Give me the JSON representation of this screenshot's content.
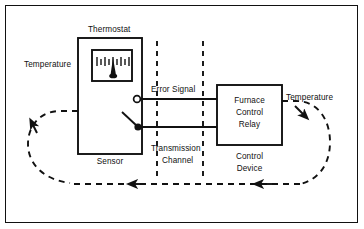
{
  "diagram": {
    "type": "block-diagram",
    "colors": {
      "line": "#111111",
      "background": "#ffffff",
      "text": "#101010"
    },
    "blocks": [
      {
        "id": "thermostat",
        "label": "Thermostat",
        "caption": "Sensor",
        "x": 78,
        "y": 38,
        "w": 64,
        "h": 116
      },
      {
        "id": "control-device",
        "label": "Furnace Control Relay",
        "label_lines": [
          "Furnace",
          "Control",
          "Relay"
        ],
        "caption_lines": [
          "Control",
          "Device"
        ],
        "x": 217,
        "y": 85,
        "w": 65,
        "h": 60
      }
    ],
    "labels": {
      "thermostat": "Thermostat",
      "temperature_in": "Temperature",
      "temperature_out": "Temperature",
      "error_signal": "Error Signal",
      "sensor": "Sensor",
      "transmission_line1": "Transmission",
      "transmission_line2": "Channel",
      "furnace_line1": "Furnace",
      "furnace_line2": "Control",
      "furnace_line3": "Relay",
      "control_device_line1": "Control",
      "control_device_line2": "Device"
    },
    "gauge": {
      "name": "temperature-gauge",
      "tick_count": 9,
      "needle_position": 0.42
    },
    "channel": {
      "name": "transmission-channel",
      "left_dashed_x": 157,
      "right_dashed_x": 203
    },
    "signal_lines": [
      {
        "name": "error-signal-line",
        "y": 99,
        "terminal": "open-circle"
      },
      {
        "name": "return-line",
        "y": 127,
        "terminal": "filled-circle-switch"
      }
    ],
    "feedback_loop": {
      "name": "feedback-loop",
      "style": "dashed",
      "direction": "counterclockwise",
      "arrow_count": 4
    }
  }
}
